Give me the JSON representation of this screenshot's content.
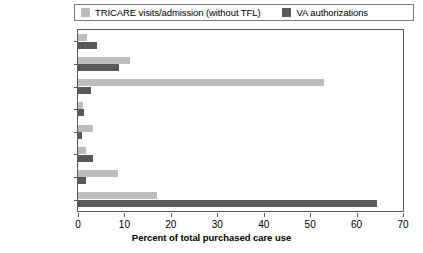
{
  "chart_data": {
    "type": "bar",
    "orientation": "horizontal",
    "title": "",
    "xlabel": "Percent of total purchased care use",
    "ylabel": "",
    "xlim": [
      0,
      70
    ],
    "xticks": [
      0,
      10,
      20,
      30,
      40,
      50,
      60,
      70
    ],
    "grid": false,
    "legend_position": "top",
    "categories": [
      "Inpatient",
      "Emergency",
      "Primary care",
      "Oncology",
      "OB/GYN",
      "Cardiology",
      "Mental health",
      "Other"
    ],
    "series": [
      {
        "name": "TRICARE visits/admission (without TFL)",
        "color": "#bdbdbd",
        "values": [
          2.0,
          11.3,
          53.0,
          1.0,
          3.2,
          1.7,
          8.6,
          17.0
        ]
      },
      {
        "name": "VA authorizations",
        "color": "#595959",
        "values": [
          4.0,
          8.8,
          2.8,
          1.2,
          0.9,
          3.2,
          1.8,
          64.5
        ]
      }
    ]
  },
  "legend": {
    "items": [
      {
        "label": "TRICARE visits/admission (without TFL)",
        "color": "#bdbdbd"
      },
      {
        "label": "VA authorizations",
        "color": "#595959"
      }
    ]
  },
  "axis": {
    "x_title": "Percent of total purchased care use",
    "x_tick_labels": [
      "0",
      "10",
      "20",
      "30",
      "40",
      "50",
      "60",
      "70"
    ]
  }
}
